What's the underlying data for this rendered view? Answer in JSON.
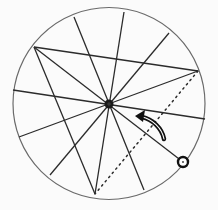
{
  "diagram": {
    "width": 218,
    "height": 210,
    "background": "#fbfbfb",
    "circle": {
      "cx": 109,
      "cy": 103.5,
      "r": 96,
      "stroke": "#6a6a6a"
    },
    "line_color": "#2b2b2b",
    "pivot": {
      "x": 109,
      "y": 104,
      "r": 4.5,
      "fill": "#1a1a1a"
    },
    "lines_through_pivot": [
      {
        "x1": 74,
        "y1": 17,
        "x2": 144,
        "y2": 190
      },
      {
        "x1": 124,
        "y1": 12,
        "x2": 95,
        "y2": 194
      },
      {
        "x1": 169,
        "y1": 33,
        "x2": 50,
        "y2": 175
      },
      {
        "x1": 13,
        "y1": 90,
        "x2": 205,
        "y2": 119
      },
      {
        "x1": 198,
        "y1": 71,
        "x2": 19,
        "y2": 137
      },
      {
        "x1": 34,
        "y1": 47,
        "x2": 183,
        "y2": 162
      }
    ],
    "chords": [
      {
        "x1": 34,
        "y1": 47,
        "x2": 198,
        "y2": 71
      },
      {
        "x1": 34,
        "y1": 47,
        "x2": 95,
        "y2": 194
      }
    ],
    "dotted_line": {
      "x1": 198,
      "y1": 71,
      "x2": 95,
      "y2": 194
    },
    "handle": {
      "x": 183,
      "y": 162,
      "r": 5,
      "stroke": "#111111"
    },
    "rotation_arrow": {
      "direction": "counter-clockwise",
      "path": "M164,139 C162,128 152,119 142,117",
      "head": "135,116 145,110 143,122",
      "color": "#111111"
    }
  }
}
